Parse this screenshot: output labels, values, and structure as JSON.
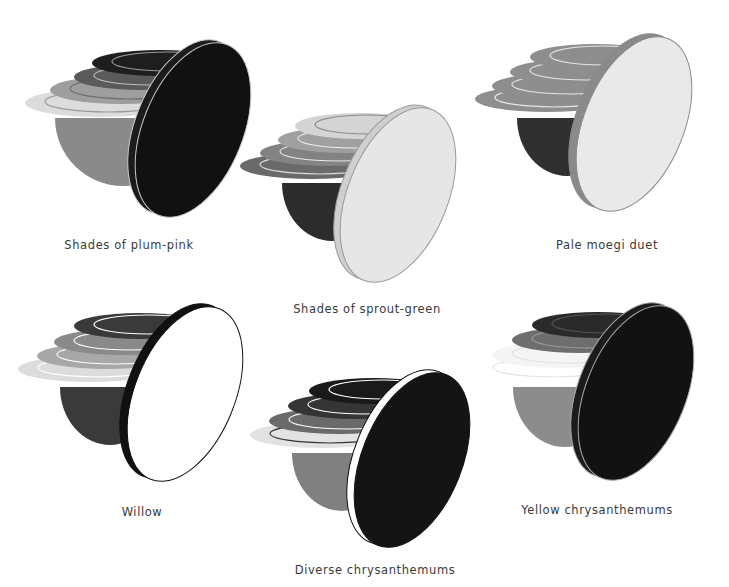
{
  "figures": [
    {
      "id": "plum-pink",
      "caption": "Shades of plum-pink",
      "caption_pos": [
        129,
        238
      ],
      "hemisphere": {
        "cx": 123,
        "cy": 118,
        "rx": 68,
        "ry": 68,
        "color": "#8a8a8a"
      },
      "layers": [
        {
          "cx": 100,
          "cy": 103,
          "rx": 75,
          "ry": 14,
          "color": "#dcdcdc",
          "line": "#9a9a9a"
        },
        {
          "cx": 122,
          "cy": 90,
          "rx": 72,
          "ry": 14,
          "color": "#9e9e9e",
          "line": "#6e6e6e"
        },
        {
          "cx": 142,
          "cy": 77,
          "rx": 68,
          "ry": 13,
          "color": "#5a5a5a",
          "line": "#bdbdbd"
        },
        {
          "cx": 160,
          "cy": 63,
          "rx": 68,
          "ry": 13,
          "color": "#1e1e1e",
          "line": "#9a9a9a"
        }
      ],
      "disc": {
        "cx": 193,
        "cy": 130,
        "rx": 50,
        "ry": 92,
        "rot": 22,
        "face": "#111111",
        "rim": "#1c1c1c",
        "edge": "#c8c8c8",
        "rim_w": 8
      }
    },
    {
      "id": "sprout-green",
      "caption": "Shades of sprout-green",
      "caption_pos": [
        367,
        302
      ],
      "hemisphere": {
        "cx": 332,
        "cy": 183,
        "rx": 50,
        "ry": 58,
        "color": "#2c2c2c"
      },
      "layers": [
        {
          "cx": 312,
          "cy": 166,
          "rx": 72,
          "ry": 13,
          "color": "#6a6a6a",
          "line": "#dddddd"
        },
        {
          "cx": 330,
          "cy": 153,
          "rx": 70,
          "ry": 13,
          "color": "#838383",
          "line": "#e8e8e8"
        },
        {
          "cx": 346,
          "cy": 140,
          "rx": 68,
          "ry": 13,
          "color": "#a0a0a0",
          "line": "#eeeeee"
        },
        {
          "cx": 360,
          "cy": 126,
          "rx": 65,
          "ry": 13,
          "color": "#d4d4d4",
          "line": "#8a8a8a"
        }
      ],
      "disc": {
        "cx": 398,
        "cy": 195,
        "rx": 50,
        "ry": 92,
        "rot": 22,
        "face": "#e6e6e6",
        "rim": "#cfcfcf",
        "edge": "#9a9a9a",
        "rim_w": 7
      }
    },
    {
      "id": "pale-moegi",
      "caption": "Pale moegi duet",
      "caption_pos": [
        607,
        238
      ],
      "hemisphere": {
        "cx": 567,
        "cy": 118,
        "rx": 50,
        "ry": 58,
        "color": "#303030"
      },
      "layers": [
        {
          "cx": 547,
          "cy": 99,
          "rx": 72,
          "ry": 13,
          "color": "#8e8e8e",
          "line": "#e6e6e6"
        },
        {
          "cx": 562,
          "cy": 86,
          "rx": 70,
          "ry": 13,
          "color": "#8e8e8e",
          "line": "#e6e6e6"
        },
        {
          "cx": 578,
          "cy": 72,
          "rx": 68,
          "ry": 13,
          "color": "#8e8e8e",
          "line": "#e6e6e6"
        },
        {
          "cx": 595,
          "cy": 57,
          "rx": 65,
          "ry": 13,
          "color": "#8e8e8e",
          "line": "#e6e6e6"
        }
      ],
      "disc": {
        "cx": 634,
        "cy": 124,
        "rx": 50,
        "ry": 92,
        "rot": 22,
        "face": "#e9e9e9",
        "rim": "#8a8a8a",
        "edge": "#8a8a8a",
        "rim_w": 8
      }
    },
    {
      "id": "willow",
      "caption": "Willow",
      "caption_pos": [
        142,
        505
      ],
      "hemisphere": {
        "cx": 110,
        "cy": 387,
        "rx": 50,
        "ry": 58,
        "color": "#3a3a3a"
      },
      "layers": [
        {
          "cx": 90,
          "cy": 369,
          "rx": 72,
          "ry": 13,
          "color": "#dcdcdc",
          "line": "#ffffff"
        },
        {
          "cx": 107,
          "cy": 356,
          "rx": 70,
          "ry": 13,
          "color": "#a8a8a8",
          "line": "#ffffff"
        },
        {
          "cx": 122,
          "cy": 342,
          "rx": 68,
          "ry": 13,
          "color": "#8a8a8a",
          "line": "#ffffff"
        },
        {
          "cx": 140,
          "cy": 326,
          "rx": 66,
          "ry": 13,
          "color": "#3a3a3a",
          "line": "#ffffff"
        }
      ],
      "disc": {
        "cx": 185,
        "cy": 394,
        "rx": 50,
        "ry": 92,
        "rot": 22,
        "face": "#ffffff",
        "rim": "#111111",
        "edge": "#111111",
        "rim_w": 8
      }
    },
    {
      "id": "diverse-chrysanthemums",
      "caption": "Diverse chrysanthemums",
      "caption_pos": [
        375,
        563
      ],
      "hemisphere": {
        "cx": 342,
        "cy": 453,
        "rx": 50,
        "ry": 58,
        "color": "#808080"
      },
      "layers": [
        {
          "cx": 322,
          "cy": 435,
          "rx": 72,
          "ry": 13,
          "color": "#e2e2e2",
          "line": "#333333"
        },
        {
          "cx": 339,
          "cy": 421,
          "rx": 70,
          "ry": 13,
          "color": "#6a6a6a",
          "line": "#ffffff"
        },
        {
          "cx": 356,
          "cy": 406,
          "rx": 68,
          "ry": 13,
          "color": "#353535",
          "line": "#ffffff"
        },
        {
          "cx": 374,
          "cy": 391,
          "rx": 65,
          "ry": 13,
          "color": "#1a1a1a",
          "line": "#ffffff"
        }
      ],
      "disc": {
        "cx": 412,
        "cy": 460,
        "rx": 50,
        "ry": 92,
        "rot": 22,
        "face": "#141414",
        "rim": "#ffffff",
        "edge": "#111111",
        "rim_w": 8
      }
    },
    {
      "id": "yellow-chrysanthemums",
      "caption": "Yellow chrysanthemums",
      "caption_pos": [
        597,
        503
      ],
      "hemisphere": {
        "cx": 565,
        "cy": 387,
        "rx": 52,
        "ry": 60,
        "color": "#8c8c8c"
      },
      "layers": [
        {
          "cx": 545,
          "cy": 369,
          "rx": 72,
          "ry": 13,
          "color": "#ffffff",
          "line": "#e4e4e4"
        },
        {
          "cx": 562,
          "cy": 355,
          "rx": 70,
          "ry": 13,
          "color": "#f4f4f4",
          "line": "#e0e0e0"
        },
        {
          "cx": 580,
          "cy": 340,
          "rx": 68,
          "ry": 13,
          "color": "#6e6e6e",
          "line": "#9a9a9a"
        },
        {
          "cx": 598,
          "cy": 325,
          "rx": 66,
          "ry": 13,
          "color": "#2a2a2a",
          "line": "#555555"
        }
      ],
      "disc": {
        "cx": 636,
        "cy": 393,
        "rx": 50,
        "ry": 92,
        "rot": 22,
        "face": "#121212",
        "rim": "#1c1c1c",
        "edge": "#a8a8a8",
        "rim_w": 8
      }
    }
  ]
}
